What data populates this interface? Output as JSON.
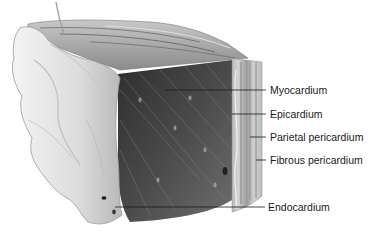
{
  "diagram": {
    "labels": [
      {
        "id": "myocardium",
        "text": "Myocardium",
        "x": 270,
        "y": 84,
        "line_from_x": 165,
        "line_y": 90
      },
      {
        "id": "epicardium",
        "text": "Epicardium",
        "x": 270,
        "y": 108,
        "line_from_x": 232,
        "line_y": 114
      },
      {
        "id": "parietal",
        "text": "Parietal pericardium",
        "x": 270,
        "y": 131,
        "line_from_x": 250,
        "line_y": 137
      },
      {
        "id": "fibrous",
        "text": "Fibrous pericardium",
        "x": 270,
        "y": 154,
        "line_from_x": 256,
        "line_y": 160
      },
      {
        "id": "endocardium",
        "text": "Endocardium",
        "x": 268,
        "y": 201,
        "line_from_x": 115,
        "line_y": 207
      }
    ],
    "colors": {
      "background": "#ffffff",
      "muscle_dark": "#3e3e3e",
      "muscle_mid": "#6a6a6a",
      "tissue_light": "#d8d8d8",
      "highlight": "#f2f2f2",
      "line": "#1a1a1a"
    }
  }
}
